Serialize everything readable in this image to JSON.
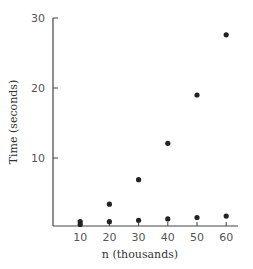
{
  "chart_data": {
    "type": "scatter",
    "title": "",
    "xlabel": "n (thousands)",
    "ylabel": "Time (seconds)",
    "x": [
      10,
      20,
      30,
      40,
      50,
      60
    ],
    "xticks": [
      10,
      20,
      30,
      40,
      50,
      60
    ],
    "yticks": [
      10,
      20,
      30
    ],
    "xlim": [
      0,
      65
    ],
    "ylim": [
      0,
      30
    ],
    "grid": false,
    "legend": null,
    "series": [
      {
        "name": "upper",
        "values": [
          0.9,
          3.4,
          6.9,
          12.1,
          19.0,
          27.6
        ]
      },
      {
        "name": "lower",
        "values": [
          0.5,
          0.9,
          1.1,
          1.3,
          1.5,
          1.7
        ]
      }
    ],
    "marker_color": "#222222"
  }
}
